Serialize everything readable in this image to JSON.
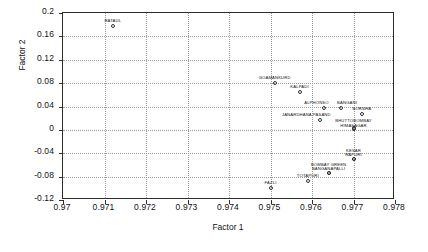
{
  "chart_data": {
    "type": "scatter",
    "title": "",
    "xlabel": "Factor 1",
    "ylabel": "Factor 2",
    "xlim": [
      0.97,
      0.978
    ],
    "ylim": [
      -0.12,
      0.2
    ],
    "xticks": [
      "0.97",
      "0.971",
      "0.972",
      "0.973",
      "0.974",
      "0.975",
      "0.976",
      "0.977",
      "0.978"
    ],
    "xtick_values": [
      0.97,
      0.971,
      0.972,
      0.973,
      0.974,
      0.975,
      0.976,
      0.977,
      0.978
    ],
    "yticks": [
      "0.2",
      "0.16",
      "0.12",
      "0.08",
      "0.04",
      "0",
      "-0.04",
      "-0.08",
      "-0.12"
    ],
    "ytick_values": [
      0.2,
      0.16,
      0.12,
      0.08,
      0.04,
      0,
      -0.04,
      -0.08,
      -0.12
    ],
    "grid": true,
    "legend": "none",
    "marker": "open-circle",
    "points": [
      {
        "label": "RATAUL",
        "x": 0.9712,
        "y": 0.178,
        "label_dy": -7,
        "label_dx": 0
      },
      {
        "label": "GOAMANKURD",
        "x": 0.9751,
        "y": 0.08,
        "label_dy": -7,
        "label_dx": 0
      },
      {
        "label": "KALPADI",
        "x": 0.9757,
        "y": 0.064,
        "label_dy": -7,
        "label_dx": 0
      },
      {
        "label": "ALPHONSO",
        "x": 0.9763,
        "y": 0.038,
        "label_dy": -7,
        "label_dx": -8
      },
      {
        "label": "BANGANI",
        "x": 0.9767,
        "y": 0.038,
        "label_dy": -7,
        "label_dx": 6
      },
      {
        "label": "BORSHA",
        "x": 0.9772,
        "y": 0.027,
        "label_dy": -7,
        "label_dx": 0
      },
      {
        "label": "JANARDHANA PASAND",
        "x": 0.9762,
        "y": 0.017,
        "label_dy": -7,
        "label_dx": -14
      },
      {
        "label": "BHUTTOBOMBAY",
        "x": 0.977,
        "y": 0.004,
        "label_dy": -9,
        "label_dx": 0
      },
      {
        "label": "HIMASAGAR",
        "x": 0.977,
        "y": 0.002,
        "label_dy": -5,
        "label_dx": 0
      },
      {
        "label": "KESAR",
        "x": 0.977,
        "y": -0.049,
        "label_dy": -10,
        "label_dx": 0
      },
      {
        "label": "RAPURI",
        "x": 0.977,
        "y": -0.049,
        "label_dy": -6,
        "label_dx": 0
      },
      {
        "label": "BOMBAY GREEN",
        "x": 0.9764,
        "y": -0.074,
        "label_dy": -10,
        "label_dx": 0
      },
      {
        "label": "BANGANAPALLI",
        "x": 0.9764,
        "y": -0.074,
        "label_dy": -6,
        "label_dx": 0
      },
      {
        "label": "TOTAPURI",
        "x": 0.9759,
        "y": -0.088,
        "label_dy": -7,
        "label_dx": 0
      },
      {
        "label": "FAZLI",
        "x": 0.975,
        "y": -0.1,
        "label_dy": -7,
        "label_dx": 0
      }
    ]
  }
}
